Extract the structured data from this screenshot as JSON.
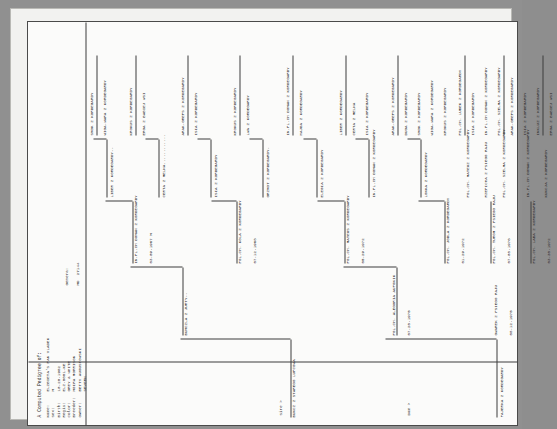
{
  "document": {
    "title": "A Computed Pedigree of:",
    "fields": [
      {
        "label": "Name:",
        "value": "ELZBIETA'S PAN VLADEK"
      },
      {
        "label": "Sex:",
        "value": "M"
      },
      {
        "label": "Birth:",
        "value": "10-20-1982"
      },
      {
        "label": "Regis:",
        "value": "ELZ-0001-KE"
      },
      {
        "label": "Color:",
        "value": "GREY & WHITE"
      },
      {
        "label": "Breeder:",
        "value": "MOIRA MORRISON"
      },
      {
        "label": "Owner:",
        "value": "BETTY AUGUSTOWSKI"
      },
      {
        "label": "",
        "value": "SEVERN"
      }
    ],
    "generations_label": "Genera:",
    "generations_value": "MD  27144"
  },
  "side_labels": {
    "sire": "Sire >",
    "dam": "Dam >"
  },
  "tree": {
    "sire_line": {
      "gen1": {
        "name": "BUNCZ Z STAREGO LUPCOWA",
        "date": ""
      },
      "gen2": [
        {
          "name": "BUMCZLA Z JURTY--",
          "date": ""
        },
        {
          "name": "POL.CH. ALEGORIA AUFONIK",
          "date": "07-20-1975"
        }
      ],
      "gen3": [
        {
          "name": "IN.PL.CH DOMAN Z KORDEGARDY",
          "date": "03-09-1967 M"
        },
        {
          "name": "POL.CH. KOLA Z KORDEGARDY",
          "date": "07-12-1968"
        },
        {
          "name": "POL.CH. MATEUS Z KORDEGARDY",
          "date": "05-29-1972"
        },
        {
          "name": "POL.CH. JODLA Z KORDEGARDY",
          "date": "01-29-1972"
        }
      ],
      "gen4": [
        {
          "name": "LIBER Z KORDEGARDY--"
        },
        {
          "name": "CERTA Z MELNA............"
        },
        {
          "name": "ISIA Z KORDEGARDY"
        },
        {
          "name": "GRZMOT Z KORDEGARDY-"
        },
        {
          "name": "ELEGIA Z KORDEGARDY"
        },
        {
          "name": "IN.PL.CH DOMAN Z KORDEGARDY"
        },
        {
          "name": "LONKA Z KORDEGARDY"
        }
      ],
      "gen5": [
        {
          "name": "SMOK Z KORDEGARDY"
        },
        {
          "name": "WIGA-WARA Z KORDEGARDY"
        },
        {
          "name": "KROKUS Z KORDEGARDY"
        },
        {
          "name": "ERGA Z BABIEJ WSI"
        },
        {
          "name": "ARAK-GREPS Z KORDEGARDY"
        },
        {
          "name": "ISIA Z KORDEGARDY"
        },
        {
          "name": "KROKUS Z KORDEGARDY"
        },
        {
          "name": "LWA Z KORDEGARDY"
        },
        {
          "name": "IN.PL.CH DOMAN Z KORDEGARDY"
        },
        {
          "name": "HAJDA Z KORDEGARDY"
        },
        {
          "name": "LIBER Z KORDEGARDY"
        },
        {
          "name": "CERTA Z MELNA"
        },
        {
          "name": "ISIA Z KORDEGARDY"
        },
        {
          "name": "ARAK-GREPS Z KORDEGARDY"
        },
        {
          "name": "DUGA Z KORDEGARDY"
        }
      ]
    },
    "dam_line": {
      "gen1": {
        "name": "FAJERKA Z KORDEGARDY",
        "date": ""
      },
      "gen2": [
        {
          "name": "GWAREK Z PSIEGO RAJU",
          "date": "08-12-1975"
        },
        {
          "name": "OLGA Z PSIEGO RAJU--",
          "date": ""
        }
      ],
      "gen3": [
        {
          "name": "POL.CH. TUROM Z PSIEGO RAJU",
          "date": "07-08-1976"
        },
        {
          "name": "POL.CH. LABA Z KORDEGARDY",
          "date": "03-30-1972"
        }
      ],
      "gen4": [
        {
          "name": "POL.CH. MATEUZ Z KORDEGARDY"
        },
        {
          "name": "RZEPICHA Z PSIEGO RAJU"
        },
        {
          "name": "POL.CH. SZELMA Z KORDEGARDY"
        },
        {
          "name": "IN.PL.CH DOMAN Z KORDEGARDY"
        },
        {
          "name": "KUNCJA Z KORDEGARDY"
        }
      ],
      "gen5": [
        {
          "name": "POL.CH. LUBEK Z KORDEGARDY"
        },
        {
          "name": "ISIA Z KORDEGARDY"
        },
        {
          "name": "IN.PL.CH DOMAN Z KORDEGARDY"
        },
        {
          "name": "POL.CH. SZELMA Z KORDEGARDY"
        },
        {
          "name": "ARAK-GREPS Z KORDEGARDY"
        },
        {
          "name": "ISIA Z KORDEGARDY"
        },
        {
          "name": "INKLUZ Z KORDEGARDY"
        },
        {
          "name": "ERGA Z BABIEJ WSI"
        },
        {
          "name": "SMOK Z KORDEGARDY"
        },
        {
          "name": "WIGA-WARA Z KORDEGARDY"
        },
        {
          "name": "KROKUS Z KORDEGARDY"
        },
        {
          "name": "ERGA Z BABIEJ WSI"
        },
        {
          "name": "LIBER Z KORDEGARDY"
        },
        {
          "name": "CERTA Z MELNA"
        },
        {
          "name": "ARAK-GREPS Z KORDEGARDY"
        },
        {
          "name": "ISIA Z KORDEGARDY"
        }
      ]
    }
  }
}
